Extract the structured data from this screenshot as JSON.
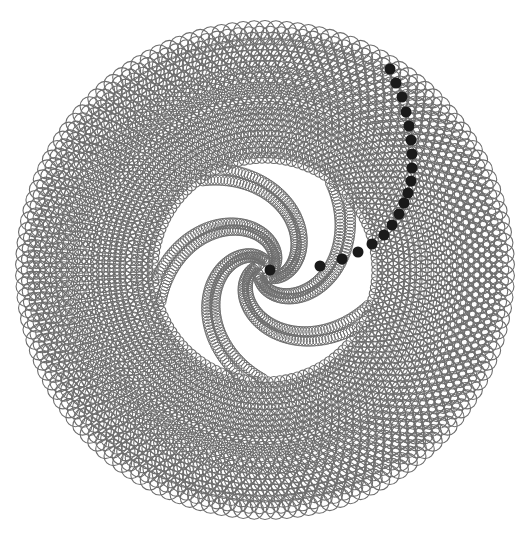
{
  "diagram": {
    "title": "",
    "type": "circle-packing-spiral",
    "canvas": {
      "width": 523,
      "height": 543,
      "background": "#ffffff"
    },
    "center": {
      "x": 265,
      "y": 270
    },
    "outer_radius": 240,
    "ring_stroke_color": "#6e6e6e",
    "highlight_color": "#1a1a1a",
    "core": {
      "arms": 5,
      "inner_radius": 8,
      "outer_radius": 110,
      "twist_turns": 0.55,
      "circle_radius": 5.2
    },
    "rings": {
      "start_radius": 112,
      "count": 24,
      "circle_radius_inner": 5.2,
      "circle_radius_outer": 9.5
    },
    "highlighted_dots": [
      [
        270,
        270
      ],
      [
        320,
        266
      ],
      [
        342,
        259
      ],
      [
        358,
        252
      ],
      [
        372,
        244
      ],
      [
        384,
        235
      ],
      [
        392,
        225
      ],
      [
        399,
        214
      ],
      [
        404,
        203
      ],
      [
        408,
        193
      ],
      [
        411,
        181
      ],
      [
        412,
        168
      ],
      [
        412,
        154
      ],
      [
        411,
        140
      ],
      [
        409,
        126
      ],
      [
        406,
        112
      ],
      [
        402,
        97
      ],
      [
        396,
        83
      ],
      [
        390,
        69
      ]
    ],
    "highlighted_dot_radius": 5.5
  }
}
